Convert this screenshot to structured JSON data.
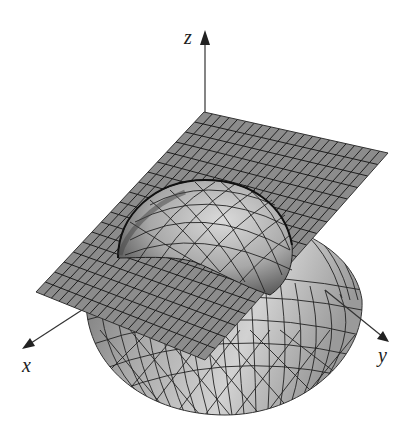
{
  "figure": {
    "axes": {
      "x_label": "x",
      "y_label": "y",
      "z_label": "z"
    },
    "surfaces": [
      {
        "name": "tilted plane",
        "color": "#8a8a8a",
        "grid": "mesh"
      },
      {
        "name": "hemisphere",
        "color": "#b4b4b4",
        "grid": "mesh"
      }
    ],
    "colors": {
      "plane_fill": "#888888",
      "plane_grid": "#1e1e1e",
      "sphere_fill": "#bdbdbd",
      "sphere_shadow": "#7a7a7a",
      "axis": "#333333"
    }
  }
}
